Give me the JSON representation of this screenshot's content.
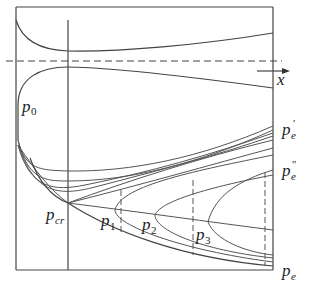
{
  "figure": {
    "axis_label": "x",
    "labels": {
      "p0": {
        "main": "p",
        "sub": "0"
      },
      "pcr": {
        "main": "p",
        "sub": "cr"
      },
      "p1": {
        "main": "p",
        "sub": "1"
      },
      "p2": {
        "main": "p",
        "sub": "2"
      },
      "p3": {
        "main": "p",
        "sub": "3"
      },
      "pe_prime": {
        "main": "p",
        "sub": "e",
        "sup": "′"
      },
      "pe_double_prime": {
        "main": "p",
        "sub": "e",
        "sup": "″"
      },
      "pe": {
        "main": "p",
        "sub": "e"
      }
    },
    "colors": {
      "line": "#444444",
      "background": "#ffffff"
    }
  }
}
